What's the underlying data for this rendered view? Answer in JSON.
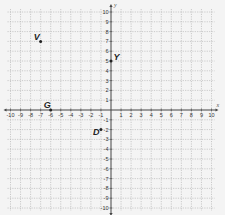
{
  "chart_data": {
    "type": "scatter",
    "title": "",
    "xlabel": "x",
    "ylabel": "y",
    "xlim": [
      -10,
      10
    ],
    "ylim": [
      -10,
      10
    ],
    "grid": true,
    "x_ticks": [
      -10,
      -9,
      -8,
      -7,
      -6,
      -5,
      -4,
      -3,
      -2,
      -1,
      1,
      2,
      3,
      4,
      5,
      6,
      7,
      8,
      9,
      10
    ],
    "y_ticks": [
      -10,
      -9,
      -8,
      -7,
      -6,
      -5,
      -4,
      -3,
      -2,
      -1,
      1,
      2,
      3,
      4,
      5,
      6,
      7,
      8,
      9,
      10
    ],
    "points": [
      {
        "label": "V",
        "x": -7,
        "y": 7
      },
      {
        "label": "Y",
        "x": 0,
        "y": 5
      },
      {
        "label": "G",
        "x": -6,
        "y": 0
      },
      {
        "label": "D",
        "x": -1,
        "y": -2
      }
    ]
  },
  "colors": {
    "background": "#f4f4f4",
    "grid": "#b8b8b8",
    "axis": "#444444",
    "point": "#222222"
  }
}
